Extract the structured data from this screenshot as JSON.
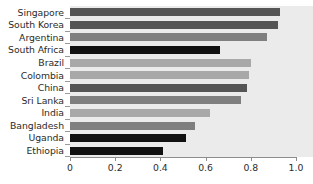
{
  "chart_data": {
    "type": "bar",
    "orientation": "horizontal",
    "title": "",
    "subtitle": "",
    "xlabel": "",
    "ylabel": "",
    "xlim": [
      0,
      1.0
    ],
    "xticks": [
      "0",
      "0.2",
      "0.4",
      "0.6",
      "0.8",
      "1.0"
    ],
    "xtick_values": [
      0,
      0.2,
      0.4,
      0.6,
      0.8,
      1.0
    ],
    "grid": false,
    "legend": "none",
    "categories": [
      "Singapore",
      "South Korea",
      "Argentina",
      "South Africa",
      "Brazil",
      "Colombia",
      "China",
      "Sri Lanka",
      "India",
      "Bangladesh",
      "Uganda",
      "Ethiopia"
    ],
    "values": [
      0.93,
      0.92,
      0.87,
      0.665,
      0.8,
      0.79,
      0.785,
      0.755,
      0.62,
      0.555,
      0.515,
      0.41
    ],
    "bar_colors": [
      "#555555",
      "#555555",
      "#7f7f7f",
      "#111111",
      "#a8a8a8",
      "#a8a8a8",
      "#555555",
      "#7f7f7f",
      "#a8a8a8",
      "#7f7f7f",
      "#111111",
      "#111111"
    ]
  },
  "style": {
    "plot_background": "#ebebeb",
    "page_background": "#ffffff",
    "axis_color": "#8d8d8d",
    "text_color": "#2b2b2b"
  }
}
